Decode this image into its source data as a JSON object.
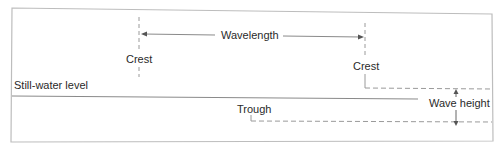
{
  "diagram": {
    "labels": {
      "crest_left": "Crest",
      "crest_right": "Crest",
      "wavelength": "Wavelength",
      "still_water": "Still-water level",
      "trough": "Trough",
      "wave_height": "Wave height"
    },
    "colors": {
      "frame": "#bdbdbd",
      "line": "#8a8a8a",
      "dash": "#9a9a9a",
      "text": "#2a2a2a",
      "background": "#ffffff"
    }
  }
}
